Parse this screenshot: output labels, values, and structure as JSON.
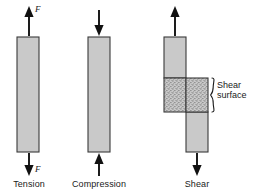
{
  "figure": {
    "type": "stress-types-diagram",
    "background_color": "#ffffff",
    "bar_fill_color": "#c9c9c9",
    "bar_stroke_color": "#3a3a3a",
    "stipple_fill_color": "#c9c9c9",
    "stipple_dot_color": "#6b6b6b",
    "arrow_color": "#111111",
    "text_color": "#1a1a1a"
  },
  "panels": [
    {
      "id": "tension",
      "caption": "Tension",
      "force_label_top": "F",
      "force_label_bottom": "F",
      "arrow_top_direction": "up",
      "arrow_bottom_direction": "down",
      "has_shear_surface": false
    },
    {
      "id": "compression",
      "caption": "Compression",
      "force_label_top": "",
      "force_label_bottom": "",
      "arrow_top_direction": "down",
      "arrow_bottom_direction": "up",
      "has_shear_surface": false
    },
    {
      "id": "shear",
      "caption": "Shear",
      "force_label_top": "",
      "force_label_bottom": "",
      "arrow_top_direction": "up",
      "arrow_bottom_direction": "down",
      "has_shear_surface": true,
      "callout_line_1": "Shear",
      "callout_line_2": "surface"
    }
  ]
}
